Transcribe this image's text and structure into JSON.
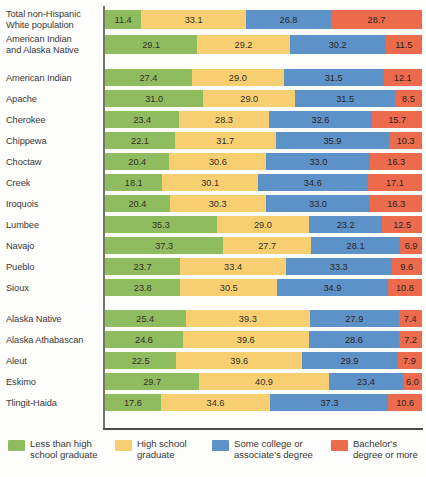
{
  "chart_data": {
    "type": "bar",
    "subtype": "stacked-horizontal-100percent",
    "title": "",
    "xlabel": "",
    "ylabel": "",
    "xlim": [
      0,
      100
    ],
    "grid": false,
    "legend_position": "bottom",
    "series": [
      {
        "name": "Less than high school graduate",
        "color": "#8fbc5e"
      },
      {
        "name": "High school graduate",
        "color": "#f7cf70"
      },
      {
        "name": "Some college or associate's degree",
        "color": "#5d92c9"
      },
      {
        "name": "Bachelor's degree or more",
        "color": "#ec6b4c"
      }
    ],
    "categories": [
      "Total non-Hispanic White population",
      "American Indian and Alaska Native",
      "American Indian",
      "Apache",
      "Cherokee",
      "Chippewa",
      "Choctaw",
      "Creek",
      "Iroquois",
      "Lumbee",
      "Navajo",
      "Pueblo",
      "Sioux",
      "Alaska Native",
      "Alaska Athabascan",
      "Aleut",
      "Eskimo",
      "Tlingit-Haida"
    ],
    "values": [
      [
        11.4,
        33.1,
        26.8,
        28.7
      ],
      [
        29.1,
        29.2,
        30.2,
        11.5
      ],
      [
        27.4,
        29.0,
        31.5,
        12.1
      ],
      [
        31.0,
        29.0,
        31.5,
        8.5
      ],
      [
        23.4,
        28.3,
        32.6,
        15.7
      ],
      [
        22.1,
        31.7,
        35.9,
        10.3
      ],
      [
        20.4,
        30.6,
        33.0,
        16.3
      ],
      [
        18.1,
        30.1,
        34.6,
        17.1
      ],
      [
        20.4,
        30.3,
        33.0,
        16.3
      ],
      [
        35.3,
        29.0,
        23.2,
        12.5
      ],
      [
        37.3,
        27.7,
        28.1,
        6.9
      ],
      [
        23.7,
        33.4,
        33.3,
        9.6
      ],
      [
        23.8,
        30.5,
        34.9,
        10.8
      ],
      [
        25.4,
        39.3,
        27.9,
        7.4
      ],
      [
        24.6,
        39.6,
        28.6,
        7.2
      ],
      [
        22.5,
        39.6,
        29.9,
        7.9
      ],
      [
        29.7,
        40.9,
        23.4,
        6.0
      ],
      [
        17.6,
        34.6,
        37.3,
        10.6
      ]
    ]
  },
  "rows": [
    {
      "label": "Total non-Hispanic\nWhite population",
      "two_line": true,
      "gap_before": false,
      "cells": [
        "11.4",
        "33.1",
        "26.8",
        "28.7"
      ],
      "v": [
        11.4,
        33.1,
        26.8,
        28.7
      ]
    },
    {
      "label": "American Indian\nand Alaska Native",
      "two_line": true,
      "gap_before": false,
      "cells": [
        "29.1",
        "29.2",
        "30.2",
        "11.5"
      ],
      "v": [
        29.1,
        29.2,
        30.2,
        11.5
      ]
    },
    {
      "label": "American Indian",
      "two_line": false,
      "gap_before": true,
      "cells": [
        "27.4",
        "29.0",
        "31.5",
        "12.1"
      ],
      "v": [
        27.4,
        29.0,
        31.5,
        12.1
      ]
    },
    {
      "label": "Apache",
      "two_line": false,
      "gap_before": false,
      "cells": [
        "31.0",
        "29.0",
        "31.5",
        "8.5"
      ],
      "v": [
        31.0,
        29.0,
        31.5,
        8.5
      ]
    },
    {
      "label": "Cherokee",
      "two_line": false,
      "gap_before": false,
      "cells": [
        "23.4",
        "28.3",
        "32.6",
        "15.7"
      ],
      "v": [
        23.4,
        28.3,
        32.6,
        15.7
      ]
    },
    {
      "label": "Chippewa",
      "two_line": false,
      "gap_before": false,
      "cells": [
        "22.1",
        "31.7",
        "35.9",
        "10.3"
      ],
      "v": [
        22.1,
        31.7,
        35.9,
        10.3
      ]
    },
    {
      "label": "Choctaw",
      "two_line": false,
      "gap_before": false,
      "cells": [
        "20.4",
        "30.6",
        "33.0",
        "16.3"
      ],
      "v": [
        20.4,
        30.6,
        33.0,
        16.3
      ]
    },
    {
      "label": "Creek",
      "two_line": false,
      "gap_before": false,
      "cells": [
        "18.1",
        "30.1",
        "34.6",
        "17.1"
      ],
      "v": [
        18.1,
        30.1,
        34.6,
        17.1
      ]
    },
    {
      "label": "Iroquois",
      "two_line": false,
      "gap_before": false,
      "cells": [
        "20.4",
        "30.3",
        "33.0",
        "16.3"
      ],
      "v": [
        20.4,
        30.3,
        33.0,
        16.3
      ]
    },
    {
      "label": "Lumbee",
      "two_line": false,
      "gap_before": false,
      "cells": [
        "35.3",
        "29.0",
        "23.2",
        "12.5"
      ],
      "v": [
        35.3,
        29.0,
        23.2,
        12.5
      ]
    },
    {
      "label": "Navajo",
      "two_line": false,
      "gap_before": false,
      "cells": [
        "37.3",
        "27.7",
        "28.1",
        "6.9"
      ],
      "v": [
        37.3,
        27.7,
        28.1,
        6.9
      ]
    },
    {
      "label": "Pueblo",
      "two_line": false,
      "gap_before": false,
      "cells": [
        "23.7",
        "33.4",
        "33.3",
        "9.6"
      ],
      "v": [
        23.7,
        33.4,
        33.3,
        9.6
      ]
    },
    {
      "label": "Sioux",
      "two_line": false,
      "gap_before": false,
      "cells": [
        "23.8",
        "30.5",
        "34.9",
        "10.8"
      ],
      "v": [
        23.8,
        30.5,
        34.9,
        10.8
      ]
    },
    {
      "label": "Alaska Native",
      "two_line": false,
      "gap_before": true,
      "cells": [
        "25.4",
        "39.3",
        "27.9",
        "7.4"
      ],
      "v": [
        25.4,
        39.3,
        27.9,
        7.4
      ]
    },
    {
      "label": "Alaska Athabascan",
      "two_line": false,
      "gap_before": false,
      "cells": [
        "24.6",
        "39.6",
        "28.6",
        "7.2"
      ],
      "v": [
        24.6,
        39.6,
        28.6,
        7.2
      ]
    },
    {
      "label": "Aleut",
      "two_line": false,
      "gap_before": false,
      "cells": [
        "22.5",
        "39.6",
        "29.9",
        "7.9"
      ],
      "v": [
        22.5,
        39.6,
        29.9,
        7.9
      ]
    },
    {
      "label": "Eskimo",
      "two_line": false,
      "gap_before": false,
      "cells": [
        "29.7",
        "40.9",
        "23.4",
        "6.0"
      ],
      "v": [
        29.7,
        40.9,
        23.4,
        6.0
      ]
    },
    {
      "label": "Tlingit-Haida",
      "two_line": false,
      "gap_before": false,
      "cells": [
        "17.6",
        "34.6",
        "37.3",
        "10.6"
      ],
      "v": [
        17.6,
        34.6,
        37.3,
        10.6
      ]
    }
  ],
  "legend": [
    {
      "label": "Less than high\nschool graduate",
      "color": "#8fbc5e"
    },
    {
      "label": "High school\ngraduate",
      "color": "#f7cf70"
    },
    {
      "label": "Some college or\nassociate's degree",
      "color": "#5d92c9"
    },
    {
      "label": "Bachelor's\ndegree or more",
      "color": "#ec6b4c"
    }
  ]
}
